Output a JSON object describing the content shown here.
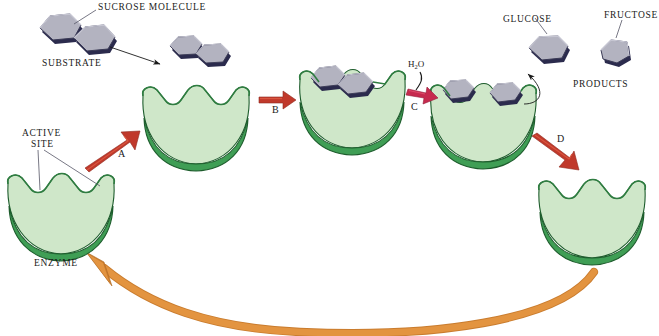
{
  "figure": {
    "type": "diagram"
  },
  "labels": {
    "sucrose_molecule": "SUCROSE MOLECULE",
    "substrate": "SUBSTRATE",
    "active_site_line1": "ACTIVE",
    "active_site_line2": "SITE",
    "enzyme": "ENZYME",
    "glucose": "GLUCOSE",
    "fructose": "FRUCTOSE",
    "products": "PRODUCTS",
    "water": "H",
    "water_sub": "2",
    "water_end": "O"
  },
  "steps": {
    "a": "A",
    "b": "B",
    "c": "C",
    "d": "D"
  },
  "colors": {
    "enzyme_top": "#bcdcb5",
    "enzyme_top_light": "#cfe7c9",
    "enzyme_rim": "#3f9e55",
    "enzyme_rim_dark": "#2f7d41",
    "enzyme_outline": "#1d5c2c",
    "molecule_face": "#b3b3c0",
    "molecule_face_light": "#c6c6d2",
    "molecule_edge": "#2b2b4d",
    "molecule_outline": "#3a3a55",
    "arrow_red": "#c0392b",
    "arrow_crimson": "#c62a4e",
    "arrow_orange": "#e39440",
    "arrow_orange_dark": "#c97c2e",
    "leader_line": "#555566",
    "text": "#1a1a1a"
  },
  "stages": [
    {
      "name": "free-enzyme-start",
      "description": "Free enzyme with open active site"
    },
    {
      "name": "enzyme-awaiting-substrate",
      "description": "Enzyme ready to bind substrate"
    },
    {
      "name": "enzyme-substrate-complex",
      "description": "Sucrose bound in active site"
    },
    {
      "name": "enzyme-product-complex",
      "description": "Glucose and fructose still in active site"
    },
    {
      "name": "free-enzyme-regenerated",
      "description": "Enzyme released and reusable"
    }
  ]
}
